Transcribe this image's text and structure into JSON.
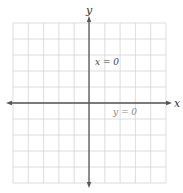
{
  "diagram": {
    "type": "coordinate-plane",
    "grid": {
      "columns": 10,
      "rows": 10,
      "left": 13,
      "top": 23,
      "right": 166,
      "bottom": 183
    },
    "axes": {
      "x_axis": {
        "label": "x",
        "y": 103,
        "x_start": 6,
        "x_end": 172
      },
      "y_axis": {
        "label": "y",
        "x": 89,
        "y_start": 16,
        "y_end": 188
      }
    },
    "annotations": [
      {
        "id": "y-axis-equation",
        "text": "x = 0",
        "x": 95,
        "y": 65
      },
      {
        "id": "x-axis-equation",
        "text": "y = 0",
        "x": 113,
        "y": 115
      }
    ],
    "colors": {
      "grid": "#d4d4d4",
      "axis": "#555555",
      "label_dark": "#444444",
      "label_light": "#8a8a8a",
      "background": "#ffffff"
    }
  }
}
